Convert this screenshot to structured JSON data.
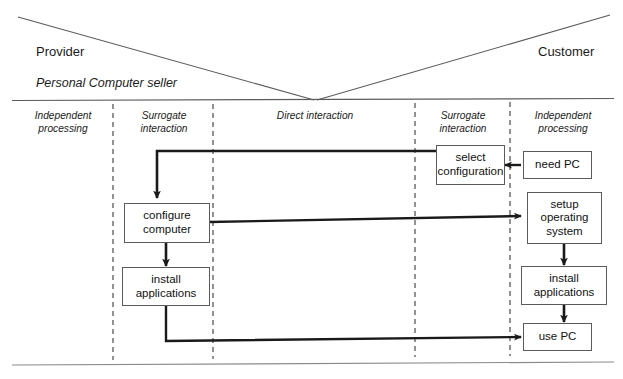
{
  "diagram": {
    "title_provider": "Provider",
    "title_customer": "Customer",
    "provider_subtitle": "Personal Computer seller",
    "columns": [
      {
        "id": "provider-independent",
        "line1": "Independent",
        "line2": "processing"
      },
      {
        "id": "provider-surrogate",
        "line1": "Surrogate",
        "line2": "interaction"
      },
      {
        "id": "direct-interaction",
        "line1": "Direct interaction",
        "line2": ""
      },
      {
        "id": "customer-surrogate",
        "line1": "Surrogate",
        "line2": "interaction"
      },
      {
        "id": "customer-independent",
        "line1": "Independent",
        "line2": "processing"
      }
    ],
    "nodes": [
      {
        "id": "select-configuration",
        "line1": "select",
        "line2": "configuration",
        "line3": ""
      },
      {
        "id": "need-pc",
        "line1": "need PC",
        "line2": "",
        "line3": ""
      },
      {
        "id": "configure-computer",
        "line1": "configure",
        "line2": "computer",
        "line3": ""
      },
      {
        "id": "setup-operating-system",
        "line1": "setup",
        "line2": "operating",
        "line3": "system"
      },
      {
        "id": "install-applications-provider",
        "line1": "install",
        "line2": "applications",
        "line3": ""
      },
      {
        "id": "install-applications-customer",
        "line1": "install",
        "line2": "applications",
        "line3": ""
      },
      {
        "id": "use-pc",
        "line1": "use PC",
        "line2": "",
        "line3": ""
      }
    ],
    "colors": {
      "line": "#5b5b5b",
      "connector": "#1a1a1a",
      "divider": "#4a4a4a",
      "background": "#ffffff"
    }
  }
}
